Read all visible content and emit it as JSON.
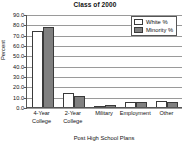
{
  "chart_data": {
    "type": "bar",
    "title": "Class of 2000",
    "xlabel": "Post High School Plans",
    "ylabel": "Percent",
    "categories": [
      "4-Year College",
      "2-Year College",
      "Military",
      "Employment",
      "Other"
    ],
    "category_lines": [
      [
        "4-Year",
        "College"
      ],
      [
        "2-Year",
        "College"
      ],
      [
        "Military"
      ],
      [
        "Employment"
      ],
      [
        "Other"
      ]
    ],
    "series": [
      {
        "name": "White %",
        "values": [
          73.5,
          13.5,
          1.0,
          4.5,
          5.5
        ],
        "color": "#ffffff"
      },
      {
        "name": "Minority %",
        "values": [
          77.5,
          11.0,
          2.0,
          4.5,
          4.5
        ],
        "color": "#808080"
      }
    ],
    "ylim": [
      0.0,
      90.0
    ],
    "ytick_step": 10.0,
    "yticks": [
      "0.0",
      "10.0",
      "20.0",
      "30.0",
      "40.0",
      "50.0",
      "60.0",
      "70.0",
      "80.0",
      "90.0"
    ],
    "grid": true,
    "legend_position": "top-right"
  },
  "legend": {
    "items": [
      {
        "label": "White %"
      },
      {
        "label": "Minority %"
      }
    ]
  }
}
